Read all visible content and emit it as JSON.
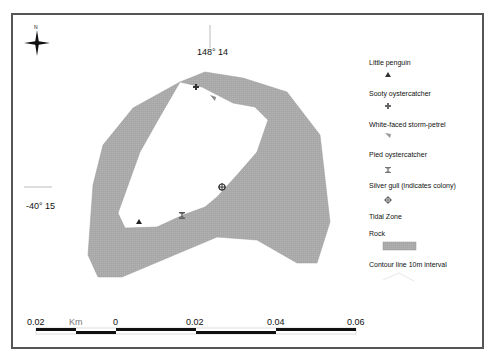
{
  "map": {
    "grid_labels": {
      "longitude": "148° 14",
      "latitude": "-40° 15"
    },
    "north_arrow": {
      "label": "N",
      "icon": "compass-rose-icon"
    },
    "colors": {
      "rock": "#a9a9a9",
      "frame": "#555555",
      "tidal_zone": "#ffffff"
    },
    "markers": [
      {
        "species": "Little penguin",
        "symbol": "triangle",
        "x": 139,
        "y": 222
      },
      {
        "species": "Sooty oystercatcher",
        "symbol": "cross",
        "x": 196,
        "y": 87
      },
      {
        "species": "White-faced storm-petrel",
        "symbol": "flag",
        "x": 213,
        "y": 98
      },
      {
        "species": "Pied oystercatcher",
        "symbol": "hourglass",
        "x": 182,
        "y": 215
      },
      {
        "species": "Silver gull (indicates colony)",
        "symbol": "crosshair",
        "x": 222,
        "y": 187
      }
    ]
  },
  "legend": {
    "items": [
      {
        "label": "Little penguin",
        "symbol": "triangle-icon"
      },
      {
        "label": "Sooty oystercatcher",
        "symbol": "cross-icon"
      },
      {
        "label": "White-faced storm-petrel",
        "symbol": "flag-icon"
      },
      {
        "label": "Pied oystercatcher",
        "symbol": "hourglass-icon"
      },
      {
        "label": "Silver gull (indicates colony)",
        "symbol": "crosshair-icon"
      },
      {
        "label": "Tidal Zone",
        "symbol": "none"
      },
      {
        "label": "Rock",
        "symbol": "gray-swatch"
      },
      {
        "label": "Contour line 10m interval",
        "symbol": "contour-line-icon"
      }
    ]
  },
  "scale_bar": {
    "unit": "Km",
    "ticks": [
      "0.02",
      "0",
      "0.02",
      "0.04",
      "0.06"
    ]
  }
}
